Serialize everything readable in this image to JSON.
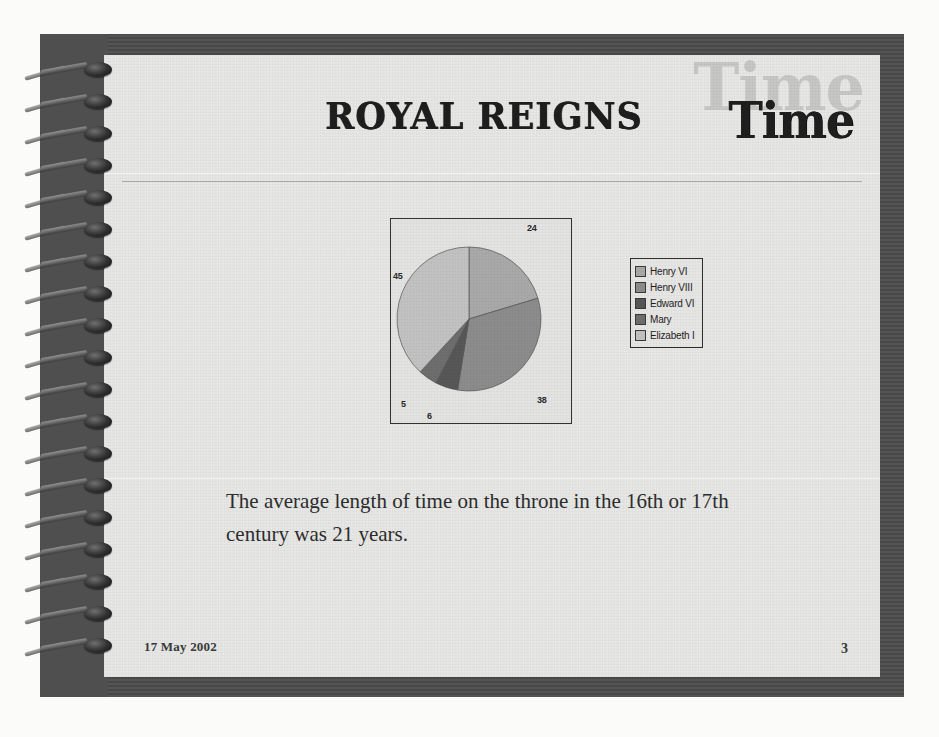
{
  "slide": {
    "title": "ROYAL REIGNS",
    "logo_text": "Time",
    "logo_ghost_text": "Time",
    "body_text": "The average length of time on the throne in the 16th or 17th century was 21 years.",
    "date": "17 May 2002",
    "page_number": "3"
  },
  "chart_data": {
    "type": "pie",
    "title": "",
    "categories": [
      "Henry VI",
      "Henry VIII",
      "Edward VI",
      "Mary",
      "Elizabeth I"
    ],
    "values": [
      24,
      38,
      6,
      5,
      45
    ],
    "labels": [
      "24",
      "38",
      "6",
      "5",
      "45"
    ],
    "legend_position": "right",
    "show_data_labels": true,
    "colors": [
      "#a9a9a9",
      "#8c8c8c",
      "#575757",
      "#6e6e6e",
      "#c2c2c2"
    ],
    "total": 118,
    "units": "years",
    "note": "Length of reign in years for English monarchs"
  },
  "colors": {
    "page_background": "#e9e9e7",
    "binder": "#4b4b4b",
    "spine": "#4f4f4f",
    "text": "#2d2d2d",
    "rule": "#8d8d8d"
  }
}
